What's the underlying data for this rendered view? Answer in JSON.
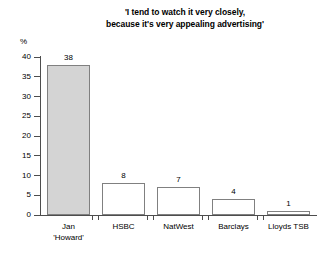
{
  "chart_data": {
    "type": "bar",
    "title": "'I tend to watch it very closely, because it's very appealing advertising'",
    "title_lines": [
      "'I tend to watch it very closely,",
      "because it's very appealing advertising'"
    ],
    "xlabel": "",
    "ylabel": "%",
    "ylim": [
      0,
      40
    ],
    "yticks": [
      0,
      5,
      10,
      15,
      20,
      25,
      30,
      35,
      40
    ],
    "ytick_labels": [
      "0",
      "5",
      "10",
      "15",
      "20",
      "25",
      "30",
      "35",
      "40"
    ],
    "grid": false,
    "legend": "none",
    "categories": [
      "Jan 'Howard'",
      "HSBC",
      "NatWest",
      "Barclays",
      "Lloyds TSB"
    ],
    "category_lines": [
      [
        "Jan",
        "'Howard'"
      ],
      [
        "HSBC"
      ],
      [
        "NatWest"
      ],
      [
        "Barclays"
      ],
      [
        "Lloyds TSB"
      ]
    ],
    "values": [
      38,
      8,
      7,
      4,
      1
    ],
    "value_labels": [
      "38",
      "8",
      "7",
      "4",
      "1"
    ],
    "bar_fills": [
      "#d4d4d4",
      "#ffffff",
      "#ffffff",
      "#ffffff",
      "#ffffff"
    ],
    "bar_outline": "#808080",
    "axis_color": "#4d4d4d",
    "background": "#ffffff"
  }
}
